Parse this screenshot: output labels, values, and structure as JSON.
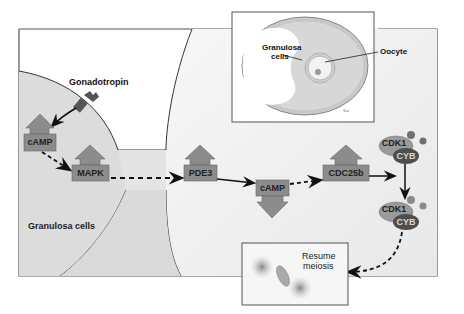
{
  "diagram": {
    "labels": {
      "gonadotropin": "Gonadotropin",
      "granulosa_cells_main": "Granulosa cells",
      "inset_granulosa_line1": "Granulosa",
      "inset_granulosa_line2": "cells",
      "inset_oocyte": "Oocyte",
      "resume_meiosis_line1": "Resume",
      "resume_meiosis_line2": "meiosis"
    },
    "nodes": {
      "camp_granulosa": "cAMP",
      "mapk": "MAPK",
      "pde3": "PDE3",
      "camp_oocyte": "cAMP",
      "cdc25b": "CDC25b",
      "cdk1_top": "CDK1",
      "cyb_top": "CYB",
      "cdk1_bottom": "CDK1",
      "cyb_bottom": "CYB"
    },
    "edges": [
      {
        "from": "gonadotropin",
        "to": "camp_granulosa",
        "style": "solid-curved"
      },
      {
        "from": "camp_granulosa",
        "to": "mapk",
        "style": "dashed"
      },
      {
        "from": "mapk",
        "to": "pde3",
        "style": "dashed"
      },
      {
        "from": "pde3",
        "to": "camp_oocyte",
        "style": "solid"
      },
      {
        "from": "camp_oocyte",
        "to": "cdc25b",
        "style": "dashed"
      },
      {
        "from": "cdc25b",
        "to": "cdk1_top",
        "style": "solid"
      },
      {
        "from": "cdk1_top",
        "to": "cdk1_bottom",
        "style": "solid"
      },
      {
        "from": "cdk1_bottom",
        "to": "resume_meiosis",
        "style": "dashed-curved"
      }
    ],
    "colors": {
      "box_fill": "#8c8c8c",
      "box_stroke": "#666666",
      "granulosa_fill": "#dcdcdc",
      "oocyte_fill": "#f1f1f1",
      "receptor": "#555555",
      "cdk1_fill": "#9a9a9a",
      "cyb_fill": "#4e4e4e",
      "phospho_dot": "#707070"
    }
  }
}
